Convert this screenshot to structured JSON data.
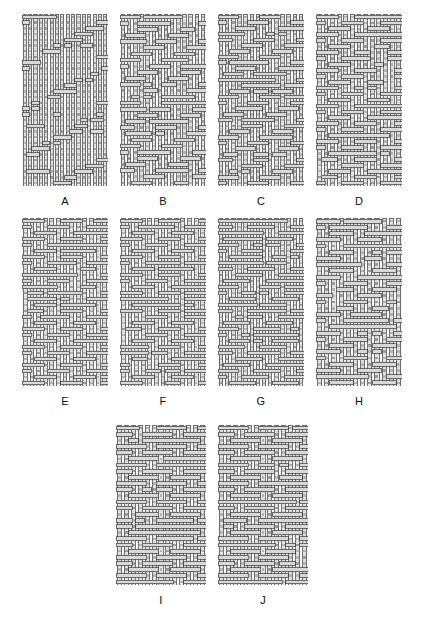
{
  "figure": {
    "panel_count": 10,
    "rows": [
      {
        "labels": [
          "A",
          "B",
          "C",
          "D"
        ]
      },
      {
        "labels": [
          "E",
          "F",
          "G",
          "H"
        ]
      },
      {
        "labels": [
          "I",
          "J"
        ]
      }
    ],
    "caption": ""
  },
  "style": {
    "background": "#ffffff",
    "yarn_fill": "#d8d8d8",
    "yarn_fill_light": "#e6e6e6",
    "yarn_stroke": "#3a3a3a",
    "yarn_stroke_soft": "#6b6b6b",
    "crossing_shade": "#8a8a8a",
    "crossing_shade_dark": "#5e5e5e",
    "label_color": "#101010"
  },
  "geometry": {
    "panel_width": 86,
    "panel_height": 172,
    "row3_panel_width": 90,
    "row3_panel_height": 160,
    "label_font_size": 11
  },
  "panels": [
    {
      "id": "A",
      "label": "A",
      "structure": "warp-faced plain derivative",
      "cols": 16,
      "rows": 30,
      "repeat": [
        16,
        8
      ],
      "float_bias": "warp",
      "weft_float_density": 0.16,
      "warp_float_length": 7,
      "weft_float_length": 3,
      "seed": 11,
      "width": 86,
      "height": 172
    },
    {
      "id": "B",
      "label": "B",
      "structure": "balanced broken twill",
      "cols": 14,
      "rows": 28,
      "repeat": [
        7,
        4
      ],
      "float_bias": "balanced",
      "weft_float_density": 0.42,
      "warp_float_length": 4,
      "weft_float_length": 4,
      "seed": 22,
      "width": 86,
      "height": 172
    },
    {
      "id": "C",
      "label": "C",
      "structure": "dense balanced twill",
      "cols": 14,
      "rows": 30,
      "repeat": [
        7,
        4
      ],
      "float_bias": "balanced",
      "weft_float_density": 0.46,
      "warp_float_length": 3,
      "weft_float_length": 4,
      "seed": 33,
      "width": 86,
      "height": 172
    },
    {
      "id": "D",
      "label": "D",
      "structure": "broken twill, warp emphasis",
      "cols": 13,
      "rows": 29,
      "repeat": [
        6,
        4
      ],
      "float_bias": "balanced",
      "weft_float_density": 0.44,
      "warp_float_length": 4,
      "weft_float_length": 4,
      "seed": 44,
      "width": 86,
      "height": 172
    },
    {
      "id": "E",
      "label": "E",
      "structure": "twill with extended weft floats",
      "cols": 13,
      "rows": 28,
      "repeat": [
        6,
        4
      ],
      "float_bias": "weft",
      "weft_float_density": 0.52,
      "warp_float_length": 3,
      "weft_float_length": 5,
      "seed": 55,
      "width": 86,
      "height": 168
    },
    {
      "id": "F",
      "label": "F",
      "structure": "basket-derived twill",
      "cols": 13,
      "rows": 28,
      "repeat": [
        6,
        4
      ],
      "float_bias": "balanced",
      "weft_float_density": 0.48,
      "warp_float_length": 4,
      "weft_float_length": 5,
      "seed": 66,
      "width": 86,
      "height": 168
    },
    {
      "id": "G",
      "label": "G",
      "structure": "broken twill, fine sett",
      "cols": 14,
      "rows": 28,
      "repeat": [
        7,
        4
      ],
      "float_bias": "balanced",
      "weft_float_density": 0.5,
      "warp_float_length": 3,
      "weft_float_length": 5,
      "seed": 77,
      "width": 86,
      "height": 168
    },
    {
      "id": "H",
      "label": "H",
      "structure": "long weft float satin derivative",
      "cols": 12,
      "rows": 27,
      "repeat": [
        6,
        5
      ],
      "float_bias": "weft",
      "weft_float_density": 0.58,
      "warp_float_length": 3,
      "weft_float_length": 7,
      "seed": 88,
      "width": 86,
      "height": 168
    },
    {
      "id": "I",
      "label": "I",
      "structure": "long weft float twill, open sett",
      "cols": 13,
      "rows": 26,
      "repeat": [
        6,
        5
      ],
      "float_bias": "weft",
      "weft_float_density": 0.6,
      "warp_float_length": 3,
      "weft_float_length": 8,
      "seed": 99,
      "width": 90,
      "height": 160
    },
    {
      "id": "J",
      "label": "J",
      "structure": "long weft float twill, dense sett",
      "cols": 13,
      "rows": 26,
      "repeat": [
        6,
        5
      ],
      "float_bias": "weft",
      "weft_float_density": 0.62,
      "warp_float_length": 3,
      "weft_float_length": 8,
      "seed": 121,
      "width": 90,
      "height": 160
    }
  ]
}
